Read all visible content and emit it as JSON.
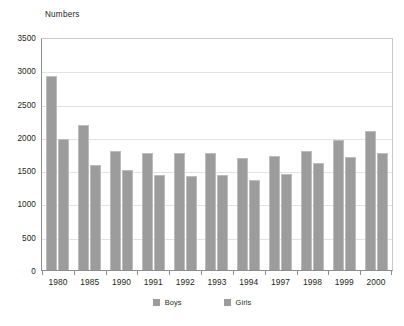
{
  "chart_data": {
    "type": "bar",
    "title": "",
    "ylabel": "Numbers",
    "xlabel": "",
    "ylim": [
      0,
      3500
    ],
    "yticks": [
      0,
      500,
      1000,
      1500,
      2000,
      2500,
      3000,
      3500
    ],
    "ytick_labels": [
      "0",
      "500",
      "1000",
      "1500",
      "2000",
      "2500",
      "3000",
      "3500"
    ],
    "grid": true,
    "legend_position": "bottom",
    "categories": [
      "1980",
      "1985",
      "1990",
      "1991",
      "1992",
      "1993",
      "1994",
      "1997",
      "1998",
      "1999",
      "2000"
    ],
    "series": [
      {
        "name": "Boys",
        "color": "#9c9c9c",
        "values": [
          2920,
          2190,
          1790,
          1770,
          1760,
          1770,
          1690,
          1720,
          1790,
          1960,
          2090
        ]
      },
      {
        "name": "Girls",
        "color": "#9c9c9c",
        "values": [
          1980,
          1590,
          1510,
          1430,
          1420,
          1440,
          1360,
          1450,
          1620,
          1710,
          1760
        ]
      }
    ]
  },
  "legend": {
    "items": [
      {
        "label": "Boys",
        "color": "#9c9c9c"
      },
      {
        "label": "Girls",
        "color": "#9c9c9c"
      }
    ]
  },
  "colors": {
    "bar_fill": "#9c9c9c",
    "bar_edge": "#bdbdbd",
    "gridline": "#e2e2e2",
    "axis": "#8d8d8d",
    "text": "#231f20",
    "background": "#ffffff"
  }
}
